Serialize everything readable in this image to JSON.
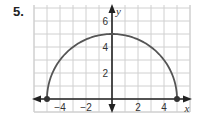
{
  "problem": {
    "number": "5."
  },
  "chart_data": {
    "type": "line",
    "title": "",
    "xlabel": "x",
    "ylabel": "y",
    "xlim": [
      -6,
      6
    ],
    "ylim": [
      -1,
      7
    ],
    "grid": true,
    "x_ticks": [
      -4,
      -2,
      2,
      4
    ],
    "y_ticks": [
      2,
      4,
      6
    ],
    "x_tick_labels": [
      "−4",
      "−2",
      "2",
      "4"
    ],
    "y_tick_labels": [
      "2",
      "4",
      "6"
    ],
    "series": [
      {
        "name": "semicircle",
        "equation": "y = sqrt(25 - x^2)",
        "x": [
          -5,
          -4,
          -3,
          -2,
          -1,
          0,
          1,
          2,
          3,
          4,
          5
        ],
        "y": [
          0,
          3,
          4,
          4.58,
          4.9,
          5,
          4.9,
          4.58,
          4,
          3,
          0
        ]
      }
    ],
    "endpoints": [
      {
        "x": -5,
        "y": 0,
        "closed": true
      },
      {
        "x": 5,
        "y": 0,
        "closed": true
      }
    ]
  },
  "colors": {
    "curve": "#555555",
    "axis": "#222222",
    "grid": "#d0d0d0"
  }
}
